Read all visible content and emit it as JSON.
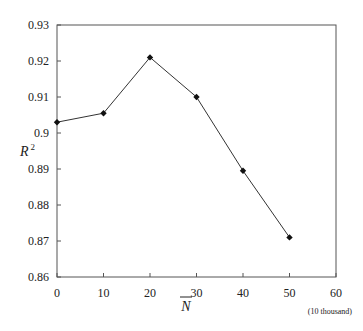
{
  "chart_data": {
    "type": "line",
    "title": "",
    "xlabel": "N̄",
    "xlabel_unit": "(10 thousand)",
    "ylabel": "R²",
    "x": [
      0,
      10,
      20,
      30,
      40,
      50
    ],
    "series": [
      {
        "name": "R2",
        "values": [
          0.903,
          0.9055,
          0.921,
          0.91,
          0.8895,
          0.871
        ]
      }
    ],
    "xlim": [
      0,
      60
    ],
    "ylim": [
      0.86,
      0.93
    ],
    "xticks": [
      "0",
      "10",
      "20",
      "30",
      "40",
      "50",
      "60"
    ],
    "yticks": [
      "0.86",
      "0.87",
      "0.88",
      "0.89",
      "0.9",
      "0.91",
      "0.92",
      "0.93"
    ],
    "grid": false,
    "legend": "none",
    "marker": "diamond",
    "line_color": "#333333"
  }
}
